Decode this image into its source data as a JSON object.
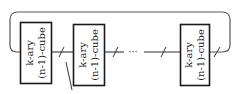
{
  "diagram": {
    "title": "",
    "stroke_color": "#1a1a1a",
    "wire_color": "#333333",
    "nodes": [
      {
        "id": "cube-1",
        "line1": "k-ary",
        "line2": "(n-1)-cube"
      },
      {
        "id": "cube-2",
        "line1": "k-ary",
        "line2": "(n-1)-cube"
      },
      {
        "id": "cube-3",
        "line1": "k-ary",
        "line2": "(n-1)-cube"
      }
    ],
    "ellipsis": "···"
  }
}
